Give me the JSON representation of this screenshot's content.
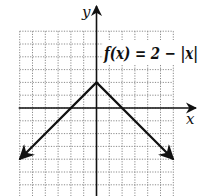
{
  "problem": {
    "number_fragment": "."
  },
  "chart_data": {
    "type": "line",
    "title": "",
    "function_label": "f(x) = 2 − |x|",
    "xlabel": "x",
    "ylabel": "y",
    "xlim": [
      -6,
      6
    ],
    "ylim": [
      -6.8,
      6
    ],
    "grid": true,
    "grid_style": "dotted",
    "tick_labels": false,
    "series": [
      {
        "name": "f(x) = 2 − |x|",
        "x": [
          -6,
          0,
          6
        ],
        "y": [
          -4,
          2,
          -4
        ],
        "arrows_at_ends": true
      }
    ],
    "vertex": {
      "x": 0,
      "y": 2
    }
  },
  "colors": {
    "ink": "#111111",
    "grid": "#8a8a8a",
    "background": "#ffffff"
  }
}
